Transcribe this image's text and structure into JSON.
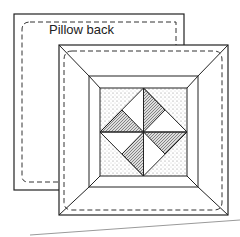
{
  "diagram": {
    "back_label": "Pillow back",
    "colors": {
      "line": "#222222",
      "stipple": "#999999",
      "baseline": "#9a9a9a"
    }
  }
}
